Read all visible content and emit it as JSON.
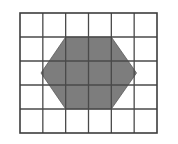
{
  "figure": {
    "background_color": "#ffffff",
    "width": 178,
    "height": 144
  },
  "grid": {
    "name": "square-grid",
    "columns": 6,
    "rows": 5,
    "origin_x": 20,
    "origin_y": 13,
    "cell_width": 22.833,
    "cell_height": 24.0,
    "line_color": "#4a4a4a",
    "outer_line_color": "#3d3d3d",
    "line_width": 1.3,
    "outer_line_width": 1.6,
    "total_cells": 30
  },
  "shape": {
    "name": "hexagon",
    "type": "hexagon",
    "sides": 6,
    "fill_color": "#7d7d7d",
    "stroke_color": "#5a5a5a",
    "stroke_width": 0.8,
    "description": "Regular-looking hexagon with flat top and bottom edges, pointed left and right vertices",
    "vertices_grid": [
      {
        "label": "top-left",
        "col": 2,
        "row": 1
      },
      {
        "label": "top-right",
        "col": 4,
        "row": 1
      },
      {
        "label": "right",
        "col": 5.1,
        "row": 2.5
      },
      {
        "label": "bottom-right",
        "col": 4,
        "row": 4
      },
      {
        "label": "bottom-left",
        "col": 2,
        "row": 4
      },
      {
        "label": "left",
        "col": 0.92,
        "row": 2.5
      }
    ],
    "vertices_px": [
      {
        "label": "top-left",
        "x": 65.7,
        "y": 37.0
      },
      {
        "label": "top-right",
        "x": 111.3,
        "y": 37.0
      },
      {
        "label": "right",
        "x": 136.5,
        "y": 73.0
      },
      {
        "label": "bottom-right",
        "x": 111.3,
        "y": 109.0
      },
      {
        "label": "bottom-left",
        "x": 65.7,
        "y": 109.0
      },
      {
        "label": "left",
        "x": 41.0,
        "y": 73.0
      }
    ],
    "shaded_area_cells": 12
  },
  "artifacts": [
    {
      "name": "left-margin-speck",
      "x": 1,
      "y": 28,
      "width": 3,
      "height": 7,
      "color": "#b8b8b8"
    }
  ]
}
